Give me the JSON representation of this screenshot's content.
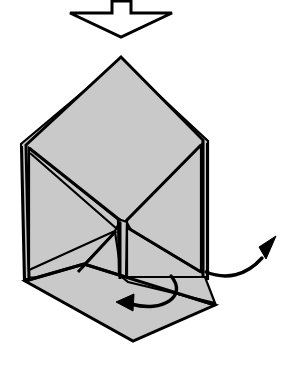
{
  "figure": {
    "kind": "origami-fold-diagram",
    "canvas": {
      "width": 287,
      "height": 365
    },
    "colors": {
      "paper_fill": "#c9c9c9",
      "outline": "#000000",
      "background": "#ffffff",
      "arrow_fill": "#ffffff"
    }
  },
  "arrows": {
    "push_down": {
      "name": "flatten-push-arrow",
      "style": "hollow-block-arrow",
      "direction": "down",
      "points": "112,1 131,1 131,13 172,13 121,37 70,13 112,13"
    },
    "swing_right": {
      "name": "swing-out-arrow",
      "style": "curved-line-arrow",
      "direction": "up-right",
      "path": "M 206,272 C 226,280 246,276 262,258",
      "head": "276,236 259,247 266,259"
    },
    "fold_under": {
      "name": "fold-under-arrow",
      "style": "curved-line-arrow",
      "direction": "left",
      "path": "M 171,276 C 188,296 163,313 131,304",
      "head": "116,302 134,294 133,311"
    }
  },
  "shapes": {
    "body_back_layer": {
      "name": "back-paper-layer",
      "points": "21,144 24,279 208,279 208,141 121,60"
    },
    "body_front": {
      "name": "main-paper-body",
      "points": "26,145 121,57 203,140 203,278 29,278"
    },
    "left_upper_flap": {
      "name": "left-upper-flap",
      "points": "29,148 120,221 115,231 29,270"
    },
    "right_upper_flap": {
      "name": "right-upper-flap",
      "points": "201,145 126,221 131,230 201,272"
    },
    "center_notch": {
      "name": "center-notch-wedge",
      "points": "118,219 127,222 126,278 119,278"
    },
    "lower_small_flap": {
      "name": "lower-inner-flap",
      "points": "78,271 115,232 122,278 78,278"
    },
    "bottom_flap": {
      "name": "bottom-folded-flap",
      "points": "25,281 84,264 215,305 133,341"
    },
    "bottom_flap_ledge": {
      "name": "bottom-flap-ledge",
      "points": "122,277 205,277 215,303 128,282"
    }
  },
  "creases": [
    {
      "name": "crease-left-diagonal",
      "d": "M 29,148 L 121,221"
    },
    {
      "name": "crease-left-inner",
      "d": "M 30,153 L 117,229"
    },
    {
      "name": "crease-right-diagonal",
      "d": "M 201,145 L 126,221"
    },
    {
      "name": "crease-right-lower",
      "d": "M 128,228 L 201,272"
    },
    {
      "name": "crease-center-vertical",
      "d": "M 120,222 L 120,279"
    },
    {
      "name": "crease-center-vertical-2",
      "d": "M 127,224 L 127,279"
    },
    {
      "name": "crease-lower-left-diagonal",
      "d": "M 78,272 L 116,231"
    },
    {
      "name": "crease-flap-top-edge",
      "d": "M 25,281 L 84,264"
    },
    {
      "name": "crease-flap-hinge",
      "d": "M 84,264 L 215,305"
    },
    {
      "name": "layer-edge-left",
      "d": "M 22,146 L 25,279"
    },
    {
      "name": "layer-edge-right",
      "d": "M 207,143 L 207,279"
    }
  ]
}
